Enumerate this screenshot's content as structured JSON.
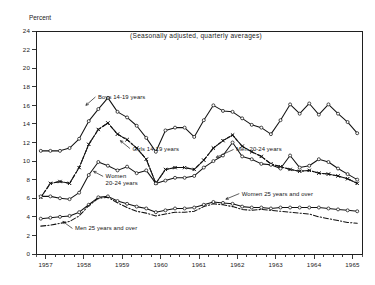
{
  "chart_data": {
    "type": "line",
    "title": "(Seasonally adjusted, quarterly averages)",
    "ylabel": "Percent",
    "xlabel": "",
    "ylim": [
      0,
      24
    ],
    "ytick_step": 2,
    "yticks": [
      "0",
      "2",
      "4",
      "6",
      "8",
      "10",
      "12",
      "14",
      "16",
      "18",
      "20",
      "22",
      "24"
    ],
    "xlim": [
      1956.75,
      1965.25
    ],
    "xticks": [
      "1957",
      "1958",
      "1959",
      "1960",
      "1961",
      "1962",
      "1963",
      "1964",
      "1965"
    ],
    "x_minor_per_year": 4,
    "grid": false,
    "legend_position": "inline-annotations",
    "x": [
      1956.875,
      1957.125,
      1957.375,
      1957.625,
      1957.875,
      1958.125,
      1958.375,
      1958.625,
      1958.875,
      1959.125,
      1959.375,
      1959.625,
      1959.875,
      1960.125,
      1960.375,
      1960.625,
      1960.875,
      1961.125,
      1961.375,
      1961.625,
      1961.875,
      1962.125,
      1962.375,
      1962.625,
      1962.875,
      1963.125,
      1963.375,
      1963.625,
      1963.875,
      1964.125,
      1964.375,
      1964.625,
      1964.875,
      1965.125
    ],
    "series": [
      {
        "name": "Boys 14-19 years",
        "style": "solid",
        "marker": "circle",
        "label_x": 1958.35,
        "label_y": 17.2,
        "values": [
          11.1,
          11.1,
          11.1,
          11.4,
          12.4,
          14.3,
          15.6,
          16.8,
          15.3,
          14.7,
          13.8,
          12.5,
          11.0,
          13.3,
          13.6,
          13.6,
          12.6,
          14.4,
          16.0,
          15.4,
          15.3,
          14.6,
          13.9,
          13.6,
          12.9,
          14.4,
          16.1,
          15.1,
          16.2,
          15.0,
          16.1,
          15.1,
          14.2,
          13.0
        ]
      },
      {
        "name": "Girls 14-19 years",
        "style": "dashed",
        "marker": "cross",
        "label_x": 1959.25,
        "label_y": 11.6,
        "values": [
          6.1,
          7.6,
          7.8,
          7.6,
          9.3,
          11.8,
          13.4,
          14.1,
          12.9,
          12.3,
          11.4,
          10.2,
          7.6,
          9.1,
          9.3,
          9.3,
          9.1,
          10.1,
          11.4,
          12.2,
          12.8,
          11.6,
          11.0,
          10.5,
          9.7,
          9.4,
          9.1,
          8.9,
          9.0,
          8.7,
          8.6,
          8.4,
          8.1,
          7.6
        ]
      },
      {
        "name": "Men 20-24 years",
        "style": "dashdot",
        "marker": "cross",
        "label_x": 1961.95,
        "label_y": 11.5,
        "values": [
          6.1,
          7.6,
          7.8,
          7.6,
          9.3,
          11.8,
          13.4,
          14.1,
          12.9,
          12.3,
          11.4,
          10.2,
          7.6,
          9.1,
          9.3,
          9.3,
          9.1,
          10.1,
          11.4,
          12.2,
          12.8,
          11.6,
          11.0,
          10.5,
          9.7,
          9.4,
          9.1,
          8.9,
          9.0,
          8.7,
          8.6,
          8.4,
          8.1,
          7.6
        ]
      },
      {
        "name": "Women 20-24 years",
        "style": "solid",
        "marker": "circle",
        "label_x": 1958.55,
        "label_y": 8.3,
        "values": [
          6.2,
          6.2,
          6.0,
          5.9,
          6.6,
          8.5,
          9.9,
          9.5,
          9.0,
          9.4,
          8.7,
          9.0,
          7.6,
          7.9,
          8.2,
          8.2,
          8.4,
          9.3,
          10.0,
          10.6,
          12.0,
          10.5,
          10.2,
          9.7,
          9.6,
          9.2,
          10.6,
          9.3,
          9.5,
          10.2,
          9.9,
          9.2,
          8.6,
          8.0
        ]
      },
      {
        "name": "Women 25 years and over",
        "style": "solid",
        "marker": "circle",
        "label_x": 1962.1,
        "label_y": 6.7,
        "values": [
          3.8,
          3.9,
          4.0,
          4.1,
          4.5,
          5.3,
          6.1,
          6.2,
          5.7,
          5.4,
          5.1,
          4.9,
          4.5,
          4.7,
          4.9,
          4.9,
          5.0,
          5.3,
          5.6,
          5.5,
          5.4,
          5.1,
          5.0,
          5.0,
          4.9,
          5.0,
          5.0,
          5.0,
          5.0,
          5.0,
          4.9,
          4.8,
          4.7,
          4.6
        ]
      },
      {
        "name": "Men 25 years and over",
        "style": "dashdot",
        "marker": "none",
        "label_x": 1957.75,
        "label_y": 2.55,
        "values": [
          3.0,
          3.1,
          3.3,
          3.5,
          4.1,
          5.2,
          6.0,
          6.1,
          5.5,
          5.0,
          4.6,
          4.4,
          4.1,
          4.3,
          4.5,
          4.5,
          4.6,
          5.1,
          5.4,
          5.3,
          5.1,
          4.8,
          4.7,
          4.8,
          4.7,
          4.6,
          4.5,
          4.4,
          4.3,
          4.0,
          3.8,
          3.6,
          3.4,
          3.3
        ]
      }
    ],
    "annotations": [
      {
        "text": "Boys 14-19 years",
        "leader_from": [
          1958.3,
          16.9
        ],
        "leader_to": [
          1958.05,
          16.0
        ]
      },
      {
        "text": "Girls 14-19 years",
        "leader_from": [
          1959.2,
          11.35
        ],
        "leader_to": [
          1958.95,
          12.2
        ]
      },
      {
        "text": "Men 20-24 years",
        "leader_from": [
          1961.9,
          11.25
        ],
        "leader_to": [
          1961.45,
          10.4
        ]
      },
      {
        "text": "Women 20-24 years",
        "leader_from": [
          1958.5,
          8.35
        ],
        "leader_to": [
          1958.25,
          8.9
        ]
      },
      {
        "text": "Women 25 years and over",
        "leader_from": [
          1962.05,
          6.5
        ],
        "leader_to": [
          1961.7,
          5.9
        ]
      },
      {
        "text": "Men 25 years and over",
        "leader_from": [
          1957.7,
          2.75
        ],
        "leader_to": [
          1957.45,
          3.5
        ]
      }
    ]
  },
  "figure": {
    "y_axis_title": "Percent",
    "subtitle": "(Seasonally adjusted, quarterly averages)"
  }
}
